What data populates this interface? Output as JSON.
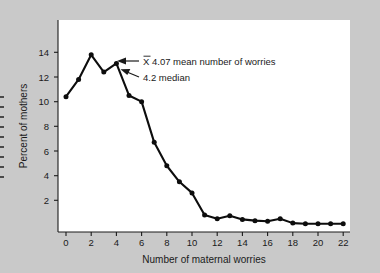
{
  "figure": {
    "background_color": "#c9c9c9",
    "panel_color": "#ffffff",
    "line_color": "#0d0d0d"
  },
  "annotations": {
    "mean_label": "X 4.07 mean number of worries",
    "mean_symbol": "X",
    "mean_rest": " 4.07 mean number of worries",
    "median_label": "4.2 median"
  },
  "chart_data": {
    "type": "line",
    "title": "",
    "xlabel": "Number of maternal worries",
    "ylabel": "Percent of mothers",
    "x": [
      0,
      1,
      2,
      3,
      4,
      5,
      6,
      7,
      8,
      9,
      10,
      11,
      12,
      13,
      14,
      15,
      16,
      17,
      18,
      19,
      20,
      21,
      22
    ],
    "values": [
      10.4,
      11.8,
      13.8,
      12.4,
      13.1,
      10.5,
      10.0,
      6.7,
      4.8,
      3.5,
      2.6,
      0.8,
      0.5,
      0.75,
      0.45,
      0.35,
      0.3,
      0.5,
      0.15,
      0.1,
      0.1,
      0.1,
      0.1
    ],
    "xlim": [
      0,
      22
    ],
    "ylim": [
      0,
      15
    ],
    "xticks": [
      0,
      2,
      4,
      6,
      8,
      10,
      12,
      14,
      16,
      18,
      20,
      22
    ],
    "xtick_labels": [
      "0",
      "2",
      "4",
      "6",
      "8",
      "10",
      "12",
      "14",
      "16",
      "18",
      "20",
      "22"
    ],
    "yticks": [
      2,
      4,
      6,
      8,
      10,
      12,
      14
    ],
    "ytick_labels": [
      "2",
      "4",
      "6",
      "8",
      "10",
      "12",
      "14"
    ],
    "grid": false,
    "legend": null,
    "markers": true,
    "annotations": [
      {
        "text": "X 4.07 mean number of worries",
        "points_to_x": 4,
        "points_to_y": 13.1
      },
      {
        "text": "4.2 median",
        "points_to_x": 4.2,
        "points_to_y": 12.6
      }
    ]
  }
}
